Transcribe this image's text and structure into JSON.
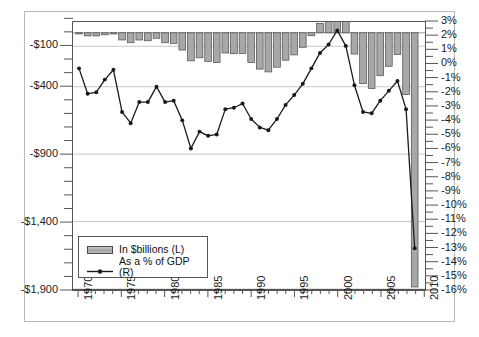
{
  "chart_data": {
    "type": "bar",
    "title": "",
    "subtitle": "",
    "xlabel": "",
    "ylabel": "",
    "grid": true,
    "legend_position": "bottom-left",
    "x": [
      1970,
      1971,
      1972,
      1973,
      1974,
      1975,
      1976,
      1977,
      1978,
      1979,
      1980,
      1981,
      1982,
      1983,
      1984,
      1985,
      1986,
      1987,
      1988,
      1989,
      1990,
      1991,
      1992,
      1993,
      1994,
      1995,
      1996,
      1997,
      1998,
      1999,
      2000,
      2001,
      2002,
      2003,
      2004,
      2005,
      2006,
      2007,
      2008,
      2009
    ],
    "xtick_labels": [
      "1970",
      "1975",
      "1980",
      "1985",
      "1990",
      "1995",
      "2000",
      "2005",
      "2010"
    ],
    "xtick_values": [
      1970,
      1975,
      1980,
      1985,
      1990,
      1995,
      2000,
      2005,
      2010
    ],
    "xlim": [
      1969.3,
      2010.2
    ],
    "left_axis": {
      "label": "In $billions (L)",
      "tick_labels": [
        "-$100",
        "-$400",
        "-$900",
        "-$1,400",
        "-$1,900"
      ],
      "tick_values": [
        -100,
        -400,
        -900,
        -1400,
        -1900
      ],
      "lim": [
        -1900,
        80
      ],
      "units": "billions of dollars"
    },
    "right_axis": {
      "label": "As a % of GDP (R)",
      "tick_labels": [
        "3%",
        "2%",
        "1%",
        "0%",
        "-1%",
        "-2%",
        "-3%",
        "-4%",
        "-5%",
        "-6%",
        "-7%",
        "-8%",
        "-9%",
        "-10%",
        "-11%",
        "-12%",
        "-13%",
        "-14%",
        "-15%",
        "-16%"
      ],
      "tick_values": [
        3,
        2,
        1,
        0,
        -1,
        -2,
        -3,
        -4,
        -5,
        -6,
        -7,
        -8,
        -9,
        -10,
        -11,
        -12,
        -13,
        -14,
        -15,
        -16
      ],
      "lim": [
        -16,
        3
      ],
      "units": "percent of GDP"
    },
    "series": [
      {
        "name": "In $billions (L)",
        "type": "bar",
        "axis": "left",
        "color": "#a8a8a8",
        "edge_color": "#4a4a4a",
        "values": [
          -2.8,
          -23,
          -23.4,
          -14.9,
          -6.1,
          -53.2,
          -73.7,
          -53.7,
          -59.2,
          -40.7,
          -73.8,
          -79,
          -128,
          -207.8,
          -185.4,
          -212.3,
          -221.2,
          -149.7,
          -155.2,
          -152.6,
          -221,
          -269.2,
          -290.3,
          -255.1,
          -203.2,
          -164,
          -107.4,
          -21.9,
          69.3,
          125.6,
          236.2,
          128.2,
          -157.8,
          -377.6,
          -412.7,
          -318.3,
          -248.2,
          -160.7,
          -458.6,
          -1885.1
        ]
      },
      {
        "name": "As a % of GDP (R)",
        "type": "line",
        "axis": "right",
        "color": "#1a1a1a",
        "marker": "circle",
        "values": [
          -0.3,
          -2.1,
          -2.0,
          -1.1,
          -0.4,
          -3.4,
          -4.2,
          -2.7,
          -2.7,
          -1.6,
          -2.7,
          -2.6,
          -4.0,
          -6.0,
          -4.8,
          -5.1,
          -5.0,
          -3.2,
          -3.1,
          -2.8,
          -3.9,
          -4.5,
          -4.7,
          -3.9,
          -2.9,
          -2.2,
          -1.4,
          -0.3,
          0.8,
          1.4,
          2.4,
          1.3,
          -1.5,
          -3.4,
          -3.5,
          -2.6,
          -1.9,
          -1.2,
          -3.2,
          -13.1
        ]
      }
    ]
  },
  "legend": {
    "items": [
      {
        "label": "In $billions (L)",
        "marker": "bar-swatch"
      },
      {
        "label": "As a % of GDP (R)",
        "marker": "line-marker"
      }
    ]
  },
  "colors": {
    "bar_fill": "#a8a8a8",
    "bar_edge": "#4a4a4a",
    "line": "#1a1a1a",
    "grid": "#c8c8c8",
    "axis": "#555555",
    "frame": "#b9b9b9",
    "text": "#1a1a1a",
    "background": "#ffffff"
  }
}
